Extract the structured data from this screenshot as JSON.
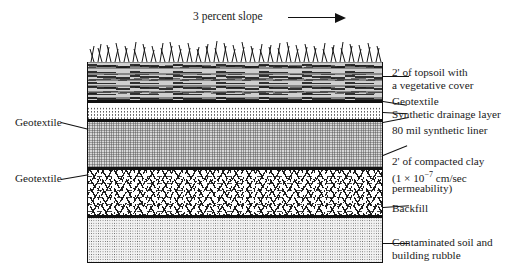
{
  "diagram": {
    "slope": {
      "text": "3 percent slope",
      "arrow_icon": "right-arrow-icon"
    },
    "layers": [
      {
        "id": "grass",
        "name": "vegetative-cover",
        "texture": "grass-blades"
      },
      {
        "id": "topsoil",
        "name": "topsoil",
        "texture": "dark-organic-streaks"
      },
      {
        "id": "geotextile-1",
        "name": "geotextile",
        "texture": "solid-black-line"
      },
      {
        "id": "drainage",
        "name": "synthetic-drainage",
        "texture": "fine-stipple"
      },
      {
        "id": "geotextile-2",
        "name": "geotextile",
        "texture": "solid-black-line"
      },
      {
        "id": "liner",
        "name": "synthetic-liner",
        "texture": "gray-crosshatch"
      },
      {
        "id": "geotextile-3",
        "name": "geotextile",
        "texture": "solid-black-line"
      },
      {
        "id": "backfill",
        "name": "backfill",
        "texture": "random-dashes"
      },
      {
        "id": "geotextile-4",
        "name": "geotextile",
        "texture": "solid-black-line"
      },
      {
        "id": "contaminated",
        "name": "contaminated-soil",
        "texture": "fine-speckle"
      }
    ],
    "right_labels": [
      {
        "line1": "2' of topsoil with",
        "line2": "a vegetative cover"
      },
      {
        "line1": "Geotextile",
        "line2": ""
      },
      {
        "line1": "Synthetic drainage layer",
        "line2": ""
      },
      {
        "line1": "80 mil synthetic liner",
        "line2": ""
      },
      {
        "line1": "2' of compacted clay",
        "line2": "(1 × 10",
        "sup": "−7",
        "line2b": " cm/sec",
        "line3": "permeability)"
      },
      {
        "line1": "Backfill",
        "line2": ""
      },
      {
        "line1": "Contaminated soil and",
        "line2": "building rubble"
      }
    ],
    "left_labels": [
      {
        "text": "Geotextile"
      },
      {
        "text": "Geotextile"
      }
    ],
    "colors": {
      "ink": "#111111",
      "topsoil": "#cfcfcf",
      "liner": "#d8d8d8",
      "contaminated": "#f2f2f2",
      "background": "#ffffff"
    }
  }
}
